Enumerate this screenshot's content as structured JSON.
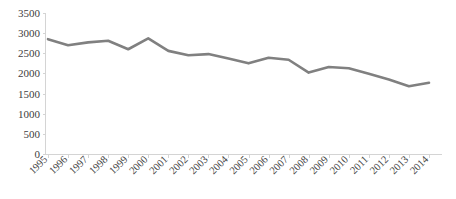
{
  "chart_data": {
    "type": "line",
    "title": "",
    "subtitle": "",
    "xlabel": "",
    "ylabel": "",
    "categories": [
      "1995",
      "1996",
      "1997",
      "1998",
      "1999",
      "2000",
      "2001",
      "2002",
      "2003",
      "2004",
      "2005",
      "2006",
      "2007",
      "2008",
      "2009",
      "2010",
      "2011",
      "2012",
      "2013",
      "2014"
    ],
    "values": [
      2850,
      2700,
      2770,
      2810,
      2600,
      2870,
      2560,
      2450,
      2480,
      2370,
      2250,
      2390,
      2340,
      2020,
      2160,
      2130,
      1990,
      1850,
      1680,
      1770
    ],
    "series": [
      {
        "name": "",
        "values": [
          2850,
          2700,
          2770,
          2810,
          2600,
          2870,
          2560,
          2450,
          2480,
          2370,
          2250,
          2390,
          2340,
          2020,
          2160,
          2130,
          1990,
          1850,
          1680,
          1770
        ],
        "color": "#808080"
      }
    ],
    "ylim": [
      0,
      3500
    ],
    "ytick_values": [
      0,
      500,
      1000,
      1500,
      2000,
      2500,
      3000,
      3500
    ],
    "ytick_labels": [
      "0",
      "500",
      "1000",
      "1500",
      "2000",
      "2500",
      "3000",
      "3500"
    ],
    "xtick_labels": [
      "1995",
      "1996",
      "1997",
      "1998",
      "1999",
      "2000",
      "2001",
      "2002",
      "2003",
      "2004",
      "2005",
      "2006",
      "2007",
      "2008",
      "2009",
      "2010",
      "2011",
      "2012",
      "2013",
      "2014"
    ],
    "grid": false,
    "legend": "none",
    "annotations": [],
    "colors": {
      "line": "#808080",
      "axis": "#d4d4d4",
      "tick_text": "#404040",
      "background": "#ffffff"
    }
  }
}
